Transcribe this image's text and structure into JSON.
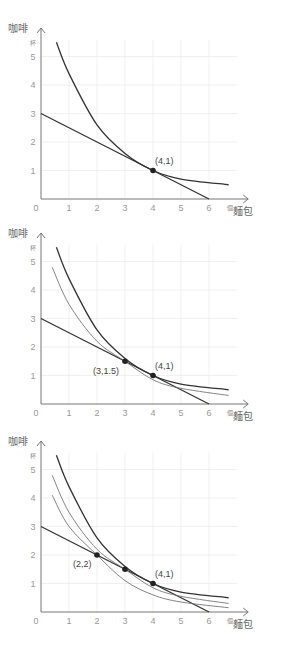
{
  "chart_data": [
    {
      "type": "line",
      "title": "",
      "xlabel": "麵包",
      "xunit": "個",
      "ylabel": "咖啡",
      "yunit": "杯",
      "xlim": [
        0,
        7
      ],
      "ylim": [
        0,
        5.5
      ],
      "x_ticks": [
        "0",
        "1",
        "2",
        "3",
        "4",
        "5",
        "6"
      ],
      "y_ticks": [
        "1",
        "2",
        "3",
        "4",
        "5"
      ],
      "grid": true,
      "series": [
        {
          "name": "budget line",
          "x": [
            0,
            6
          ],
          "y": [
            3,
            0
          ]
        },
        {
          "name": "indifference curve (4,1)",
          "x": [
            0.55,
            1,
            2,
            3,
            4,
            5,
            6.7
          ],
          "y": [
            5.5,
            4.4,
            2.6,
            1.6,
            1.0,
            0.7,
            0.5
          ]
        }
      ],
      "points": [
        {
          "x": 4,
          "y": 1,
          "label": "(4,1)"
        }
      ]
    },
    {
      "type": "line",
      "title": "",
      "xlabel": "麵包",
      "xunit": "個",
      "ylabel": "咖啡",
      "yunit": "杯",
      "xlim": [
        0,
        7
      ],
      "ylim": [
        0,
        5.5
      ],
      "x_ticks": [
        "0",
        "1",
        "2",
        "3",
        "4",
        "5",
        "6"
      ],
      "y_ticks": [
        "1",
        "2",
        "3",
        "4",
        "5"
      ],
      "grid": true,
      "series": [
        {
          "name": "budget line",
          "x": [
            0,
            6
          ],
          "y": [
            3,
            0
          ]
        },
        {
          "name": "indifference curve (4,1)",
          "x": [
            0.55,
            1,
            2,
            3,
            4,
            5,
            6.7
          ],
          "y": [
            5.5,
            4.4,
            2.6,
            1.6,
            1.0,
            0.7,
            0.5
          ]
        },
        {
          "name": "indifference curve (3,1.5)",
          "x": [
            0.4,
            1,
            2,
            3,
            4,
            5,
            6.7
          ],
          "y": [
            4.8,
            3.5,
            2.2,
            1.5,
            0.85,
            0.55,
            0.3
          ]
        }
      ],
      "points": [
        {
          "x": 3,
          "y": 1.5,
          "label": "(3,1.5)"
        },
        {
          "x": 4,
          "y": 1,
          "label": "(4,1)"
        }
      ]
    },
    {
      "type": "line",
      "title": "",
      "xlabel": "麵包",
      "xunit": "個",
      "ylabel": "咖啡",
      "yunit": "杯",
      "xlim": [
        0,
        7
      ],
      "ylim": [
        0,
        5.5
      ],
      "x_ticks": [
        "0",
        "1",
        "2",
        "3",
        "4",
        "5",
        "6"
      ],
      "y_ticks": [
        "1",
        "2",
        "3",
        "4",
        "5"
      ],
      "grid": true,
      "series": [
        {
          "name": "budget line",
          "x": [
            0,
            6
          ],
          "y": [
            3,
            0
          ]
        },
        {
          "name": "indifference curve (4,1)",
          "x": [
            0.55,
            1,
            2,
            3,
            4,
            5,
            6.7
          ],
          "y": [
            5.5,
            4.4,
            2.6,
            1.6,
            1.0,
            0.7,
            0.5
          ]
        },
        {
          "name": "indifference curve (3,1.5)",
          "x": [
            0.4,
            1,
            2,
            3,
            4,
            5,
            6.7
          ],
          "y": [
            4.8,
            3.5,
            2.2,
            1.5,
            0.85,
            0.55,
            0.3
          ]
        },
        {
          "name": "indifference curve (2,2)",
          "x": [
            0.4,
            1,
            2,
            3,
            4,
            5,
            6.7
          ],
          "y": [
            4.1,
            3.0,
            2.0,
            1.1,
            0.6,
            0.35,
            0.15
          ]
        }
      ],
      "points": [
        {
          "x": 2,
          "y": 2,
          "label": "(2,2)"
        },
        {
          "x": 3,
          "y": 1.5,
          "label": ""
        },
        {
          "x": 4,
          "y": 1,
          "label": "(4,1)"
        }
      ]
    }
  ]
}
